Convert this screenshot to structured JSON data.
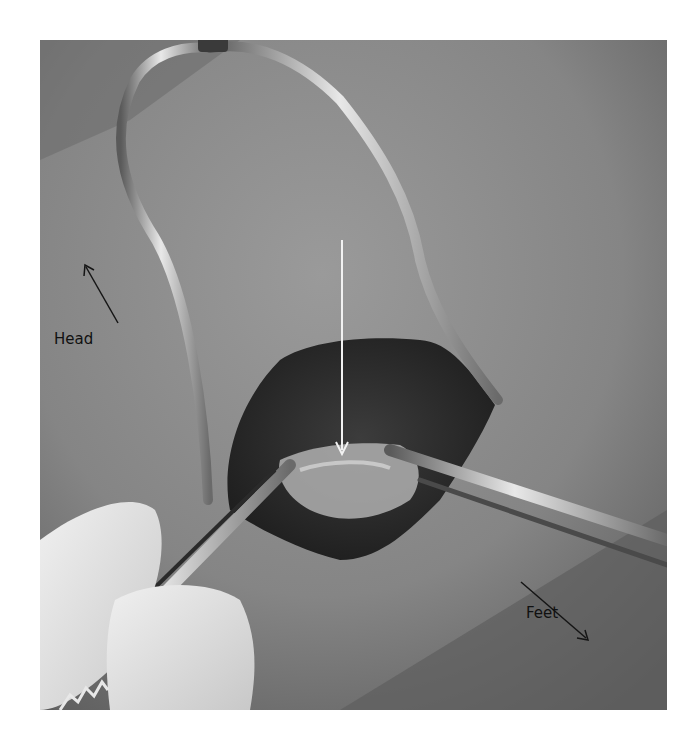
{
  "figure": {
    "type": "photograph",
    "tone": "grayscale",
    "annotations": {
      "head_label": "Head",
      "feet_label": "Feet",
      "head_arrow_direction": "up-left",
      "feet_arrow_direction": "down-right",
      "center_arrow": {
        "color": "#f2f2f2",
        "direction": "down",
        "points_to": "exposed tissue in incision"
      }
    },
    "colors": {
      "skin": "#8c8c8c",
      "incision": "#2e2e2e",
      "tissue": "#b4b4b4",
      "metal": "#d9d9d9",
      "glove": "#e6e6e6",
      "annotation_text": "#111111"
    }
  }
}
